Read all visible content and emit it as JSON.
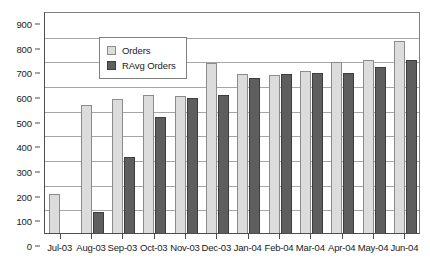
{
  "chart_data": {
    "type": "bar",
    "title": "",
    "subtitle": "",
    "xlabel": "",
    "ylabel": "",
    "categories": [
      "Jul-03",
      "Aug-03",
      "Sep-03",
      "Oct-03",
      "Nov-03",
      "Dec-03",
      "Jan-04",
      "Feb-04",
      "Mar-04",
      "Apr-04",
      "May-04",
      "Jun-04"
    ],
    "series": [
      {
        "name": "Orders",
        "color": "#dcdcdc",
        "values": [
          160,
          520,
          543,
          560,
          555,
          690,
          645,
          640,
          655,
          695,
          700,
          780
        ]
      },
      {
        "name": "RAvg Orders",
        "color": "#5e5e5e",
        "values": [
          null,
          85,
          310,
          470,
          548,
          560,
          628,
          645,
          650,
          648,
          672,
          700
        ]
      }
    ],
    "ylim": [
      0,
      900
    ],
    "ytick_step": 100,
    "yticks": [
      900,
      800,
      700,
      600,
      500,
      400,
      300,
      200,
      100,
      0
    ],
    "grid": true,
    "grid_axis": "y",
    "legend_position": "top-left",
    "legend_entries": [
      "Orders",
      "RAvg Orders"
    ]
  }
}
